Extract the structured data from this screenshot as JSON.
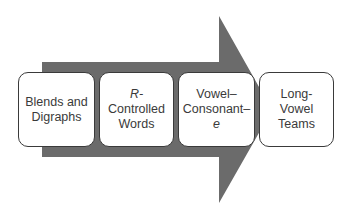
{
  "diagram": {
    "type": "process-arrow",
    "arrow_color": "#6b6b6b",
    "steps": [
      {
        "lines": [
          "Blends and",
          "Digraphs"
        ]
      },
      {
        "lines": [
          "R-",
          "Controlled",
          "Words"
        ],
        "italic_line": 0
      },
      {
        "lines": [
          "Vowel–",
          "Consonant–",
          "e"
        ],
        "italic_line": 2
      },
      {
        "lines": [
          "Long-Vowel",
          "Teams"
        ]
      }
    ]
  }
}
